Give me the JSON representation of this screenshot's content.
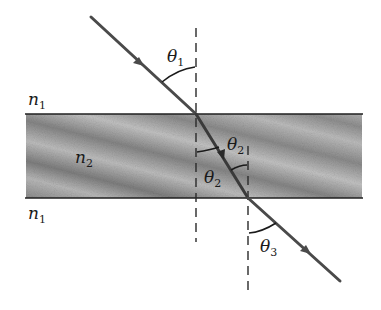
{
  "diagram": {
    "media": {
      "top": {
        "symbol": "n",
        "subscript": "1"
      },
      "slab": {
        "symbol": "n",
        "subscript": "2"
      },
      "bottom": {
        "symbol": "n",
        "subscript": "1"
      }
    },
    "angles": {
      "incident": {
        "symbol": "θ",
        "subscript": "1"
      },
      "refracted_inside_top": {
        "symbol": "θ",
        "subscript": "2"
      },
      "refracted_inside_bottom": {
        "symbol": "θ",
        "subscript": "2"
      },
      "emergent": {
        "symbol": "θ",
        "subscript": "3"
      }
    },
    "colors": {
      "ray": "#4a4a4a",
      "slab_fill": "#8c8c8c",
      "slab_light": "#c4c4c4",
      "boundary": "#1f1f1f",
      "normal": "#2a2a2a"
    }
  }
}
